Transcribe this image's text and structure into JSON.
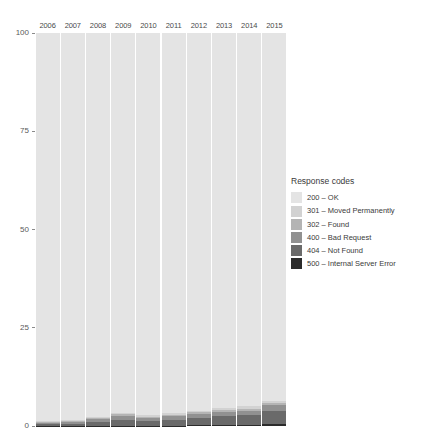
{
  "chart_data": {
    "type": "bar",
    "subtype": "stacked-percentage",
    "title": "",
    "xlabel": "",
    "ylabel": "",
    "ylim": [
      0,
      100
    ],
    "yticks": [
      0,
      25,
      50,
      75,
      100
    ],
    "ytick_labels": [
      "0",
      "25",
      "50",
      "75",
      "100"
    ],
    "grid": false,
    "legend_position": "right",
    "legend_title": "Response codes",
    "categories": [
      "2006",
      "2007",
      "2008",
      "2009",
      "2010",
      "2011",
      "2012",
      "2013",
      "2014",
      "2015"
    ],
    "series": [
      {
        "name": "200 - OK",
        "code": "200",
        "color": "#e4e4e4",
        "values": [
          98.8,
          98.5,
          97.6,
          96.6,
          97.3,
          96.8,
          96.1,
          95.4,
          95.0,
          93.6
        ]
      },
      {
        "name": "301 - Moved Permanently",
        "code": "301",
        "color": "#d2d2d2",
        "values": [
          0.25,
          0.3,
          0.35,
          0.4,
          0.35,
          0.4,
          0.45,
          0.5,
          0.55,
          0.6
        ]
      },
      {
        "name": "302 - Found",
        "code": "302",
        "color": "#b4b4b4",
        "values": [
          0.2,
          0.25,
          0.3,
          0.35,
          0.3,
          0.35,
          0.4,
          0.45,
          0.5,
          0.55
        ]
      },
      {
        "name": "400 - Bad Request",
        "code": "400",
        "color": "#919191",
        "values": [
          0.35,
          0.45,
          0.75,
          1.05,
          0.75,
          0.85,
          0.95,
          1.05,
          1.15,
          1.35
        ]
      },
      {
        "name": "404 - Not Found",
        "code": "404",
        "color": "#6a6a6a",
        "values": [
          0.35,
          0.45,
          0.9,
          1.5,
          1.2,
          1.5,
          1.9,
          2.3,
          2.5,
          3.3
        ]
      },
      {
        "name": "500 - Internal Server Error",
        "code": "500",
        "color": "#2b2b2b",
        "values": [
          0.05,
          0.05,
          0.1,
          0.1,
          0.1,
          0.1,
          0.2,
          0.3,
          0.3,
          0.6
        ]
      }
    ]
  },
  "legend": {
    "title": "Response codes",
    "items": [
      {
        "label": "200 – OK",
        "color": "#e4e4e4"
      },
      {
        "label": "301 – Moved Permanently",
        "color": "#d2d2d2"
      },
      {
        "label": "302 – Found",
        "color": "#b4b4b4"
      },
      {
        "label": "400 – Bad Request",
        "color": "#919191"
      },
      {
        "label": "404 – Not Found",
        "color": "#6a6a6a"
      },
      {
        "label": "500 – Internal Server Error",
        "color": "#2b2b2b"
      }
    ]
  }
}
